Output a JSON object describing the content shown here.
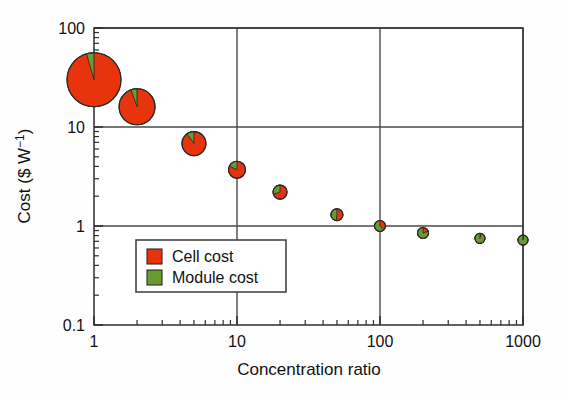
{
  "chart_data": {
    "type": "scatter",
    "title": "",
    "xlabel": "Concentration ratio",
    "ylabel": "Cost ($ W⁻¹)",
    "xscale": "log",
    "yscale": "log",
    "xlim": [
      1,
      1000
    ],
    "ylim": [
      0.1,
      100
    ],
    "grid": true,
    "x_ticks": [
      "1",
      "10",
      "100",
      "1000"
    ],
    "x_tick_values": [
      1,
      10,
      100,
      1000
    ],
    "y_ticks": [
      "0.1",
      "1",
      "10",
      "100"
    ],
    "y_tick_values": [
      0.1,
      1,
      10,
      100
    ],
    "legend_position": "lower-left-inside",
    "marker_style": "pie",
    "series": [
      {
        "name": "Cell cost",
        "color": "#E8340C"
      },
      {
        "name": "Module cost",
        "color": "#6A9B33"
      }
    ],
    "x": [
      1,
      2,
      5,
      10,
      20,
      50,
      100,
      200,
      500,
      1000
    ],
    "total_cost": [
      30,
      16,
      6.8,
      3.7,
      2.2,
      1.3,
      1.0,
      0.85,
      0.75,
      0.72
    ],
    "points": [
      {
        "x": 1,
        "total": 30,
        "radius_px": 27,
        "cell_fraction": 0.955,
        "module_fraction": 0.045
      },
      {
        "x": 2,
        "total": 16,
        "radius_px": 18,
        "cell_fraction": 0.945,
        "module_fraction": 0.055
      },
      {
        "x": 5,
        "total": 6.8,
        "radius_px": 12,
        "cell_fraction": 0.9,
        "module_fraction": 0.1
      },
      {
        "x": 10,
        "total": 3.7,
        "radius_px": 8.5,
        "cell_fraction": 0.82,
        "module_fraction": 0.18
      },
      {
        "x": 20,
        "total": 2.2,
        "radius_px": 7,
        "cell_fraction": 0.7,
        "module_fraction": 0.3
      },
      {
        "x": 50,
        "total": 1.3,
        "radius_px": 6,
        "cell_fraction": 0.52,
        "module_fraction": 0.48
      },
      {
        "x": 100,
        "total": 1.0,
        "radius_px": 5.5,
        "cell_fraction": 0.38,
        "module_fraction": 0.62
      },
      {
        "x": 200,
        "total": 0.85,
        "radius_px": 5.5,
        "cell_fraction": 0.2,
        "module_fraction": 0.8
      },
      {
        "x": 500,
        "total": 0.75,
        "radius_px": 5,
        "cell_fraction": 0.04,
        "module_fraction": 0.96
      },
      {
        "x": 1000,
        "total": 0.72,
        "radius_px": 5,
        "cell_fraction": 0.02,
        "module_fraction": 0.98
      }
    ]
  },
  "legend": {
    "entries": [
      {
        "label": "Cell cost",
        "color": "#E8340C"
      },
      {
        "label": "Module cost",
        "color": "#6A9B33"
      }
    ]
  },
  "axes": {
    "x_title": "Concentration ratio",
    "y_title": "Cost ($ W⁻¹)",
    "x_tick_labels": [
      "1",
      "10",
      "100",
      "1000"
    ],
    "y_tick_labels": [
      "0.1",
      "1",
      "10",
      "100"
    ]
  },
  "colors": {
    "cell": "#E8340C",
    "module": "#6A9B33",
    "frame": "#3a3a3a",
    "background": "#ffffff"
  }
}
